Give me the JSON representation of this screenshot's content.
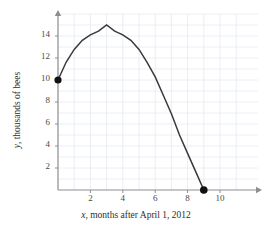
{
  "chart_data": {
    "type": "line",
    "title": "",
    "subtitle": "",
    "xlabel": "x, months after April 1, 2012",
    "xlabel_variable": "x",
    "xlabel_rest": ", months after April 1, 2012",
    "ylabel": "y, thousands of bees",
    "ylabel_variable": "y",
    "ylabel_rest": ", thousands of bees",
    "xlim": [
      0,
      11.6
    ],
    "ylim": [
      0,
      15.6
    ],
    "xticks": [
      2,
      4,
      6,
      8,
      10
    ],
    "yticks": [
      2,
      4,
      6,
      8,
      10,
      12,
      14
    ],
    "xtick_labels": [
      "2",
      "4",
      "6",
      "8",
      "10"
    ],
    "ytick_labels": [
      "2",
      "4",
      "6",
      "8",
      "10",
      "12",
      "14"
    ],
    "grid": true,
    "grid_x_step": 1,
    "grid_y_step": 1,
    "grid_color": "#e3e9f0",
    "legend": null,
    "axis_color": "#8d8d8d",
    "curve_color": "#3a3a3a",
    "marker_color": "#111111",
    "series": [
      {
        "name": "bee population",
        "shape": "downward parabola",
        "vertex": [
          3,
          15
        ],
        "x": [
          0,
          0.5,
          1,
          1.5,
          2,
          2.5,
          3,
          3.5,
          4,
          4.5,
          5,
          5.5,
          6,
          6.5,
          7,
          7.5,
          8,
          8.5,
          9
        ],
        "y": [
          10.0,
          11.61,
          12.78,
          13.61,
          14.11,
          14.44,
          15.0,
          14.44,
          14.11,
          13.61,
          12.78,
          11.61,
          10.28,
          8.61,
          6.94,
          5.0,
          3.33,
          1.67,
          0.0
        ]
      }
    ],
    "points": [
      {
        "label": "start-point",
        "x": 0,
        "y": 10
      },
      {
        "label": "end-point",
        "x": 9,
        "y": 0
      }
    ]
  },
  "plot": {
    "origin_px": {
      "x": 58,
      "y": 190
    },
    "x_unit_px": 16.2,
    "y_unit_px": 11.0
  }
}
